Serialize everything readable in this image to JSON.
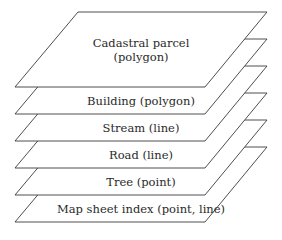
{
  "diagram": {
    "type": "stacked-layers",
    "layers": [
      {
        "label_line1": "Cadastral parcel",
        "label_line2": "(polygon)"
      },
      {
        "label": "Building (polygon)"
      },
      {
        "label": "Stream (line)"
      },
      {
        "label": "Road (line)"
      },
      {
        "label": "Tree (point)"
      },
      {
        "label": "Map sheet index (point, line)"
      }
    ],
    "colors": {
      "stroke": "#333333",
      "fill": "#ffffff",
      "text": "#2a2a2a"
    }
  }
}
